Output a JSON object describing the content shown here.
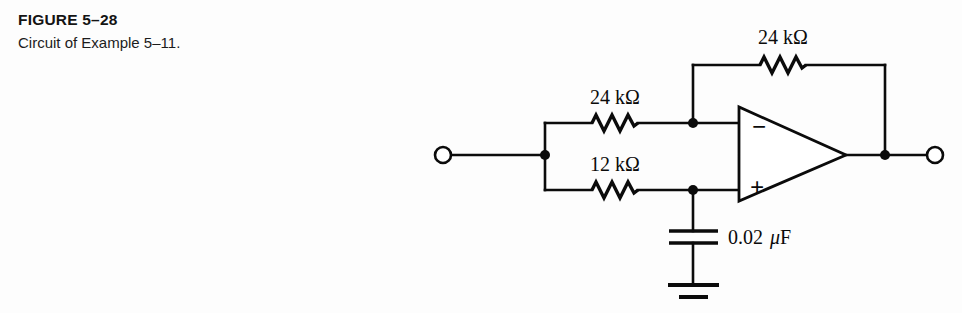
{
  "caption": {
    "figure_label": "FIGURE 5–28",
    "description": "Circuit of Example 5–11."
  },
  "circuit": {
    "title": "Circuit of Example 5-11",
    "ink_color": "#0b0b0b",
    "background_color": "#fdfdfd",
    "components": {
      "feedback_resistor": {
        "name": "feedback-resistor",
        "value": "24 kΩ",
        "symbol": "resistor-zigzag"
      },
      "input_resistor_top": {
        "name": "input-resistor-top",
        "value": "24 kΩ",
        "symbol": "resistor-zigzag"
      },
      "input_resistor_bottom": {
        "name": "input-resistor-bottom",
        "value": "12 kΩ",
        "symbol": "resistor-zigzag"
      },
      "capacitor": {
        "name": "capacitor",
        "value_number": "0.02",
        "value_unit_mu": "μ",
        "value_unit_f": "F",
        "symbol": "capacitor-parallel-plates"
      },
      "opamp": {
        "name": "operational-amplifier",
        "inverting_label": "−",
        "noninverting_label": "+",
        "symbol": "triangle"
      },
      "ground": {
        "name": "ground",
        "symbol": "ground-two-bar"
      },
      "input_terminal": {
        "name": "input-terminal",
        "symbol": "open-circle"
      },
      "output_terminal": {
        "name": "output-terminal",
        "symbol": "open-circle"
      }
    }
  }
}
